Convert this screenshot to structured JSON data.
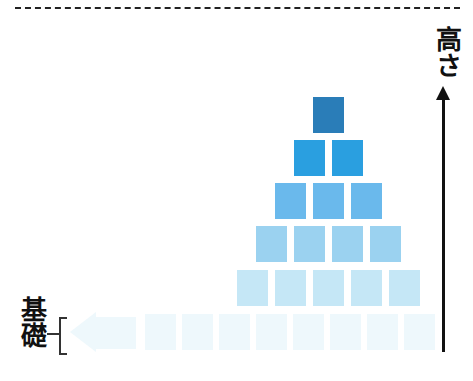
{
  "labels": {
    "height_axis": "高さ",
    "base": "基礎"
  },
  "colors": {
    "level1": "#2A7DB8",
    "level2": "#2A9FE0",
    "level3": "#6AB9EC",
    "level4": "#9BD2F0",
    "level5": "#C5E7F6",
    "level6": "#EEF8FC",
    "axis": "#111111"
  },
  "pyramid": {
    "rows": [
      {
        "level": 1,
        "blocks": 1
      },
      {
        "level": 2,
        "blocks": 2
      },
      {
        "level": 3,
        "blocks": 3
      },
      {
        "level": 4,
        "blocks": 4
      },
      {
        "level": 5,
        "blocks": 5
      },
      {
        "level": 6,
        "blocks": 8
      }
    ]
  }
}
